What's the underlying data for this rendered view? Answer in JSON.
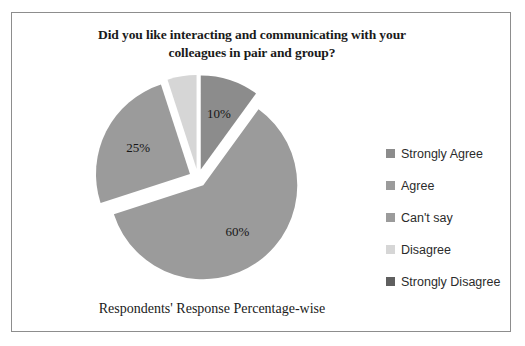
{
  "frame": {
    "border_color": "#8d8d8d",
    "background": "#ffffff"
  },
  "chart_data": {
    "type": "pie",
    "title": "Did you like interacting and communicating with your colleagues in pair and group?",
    "title_line1": "Did you like interacting and communicating with your",
    "title_line2": "colleagues in pair and group?",
    "xlabel": "Respondents' Response Percentage-wise",
    "ylabel": "",
    "legend_position": "right",
    "exploded": true,
    "start_angle_deg": 0,
    "direction": "clockwise",
    "categories": [
      "Strongly Agree",
      "Agree",
      "Can't say",
      "Disagree",
      "Strongly Disagree"
    ],
    "values": [
      10,
      60,
      25,
      5,
      0
    ],
    "data_labels": [
      "10%",
      "60%",
      "25%",
      "5%",
      "0%"
    ],
    "colors": [
      "#8c8c8c",
      "#9b9b9b",
      "#9b9b9b",
      "#d6d6d6",
      "#5f5f5f"
    ],
    "slices": [
      {
        "label": "Strongly Agree",
        "value": 10,
        "display": "10%",
        "color": "#8c8c8c",
        "label_inside": true
      },
      {
        "label": "Agree",
        "value": 60,
        "display": "60%",
        "color": "#9b9b9b",
        "label_inside": true
      },
      {
        "label": "Can't say",
        "value": 25,
        "display": "25%",
        "color": "#9b9b9b",
        "label_inside": true
      },
      {
        "label": "Disagree",
        "value": 5,
        "display": "5%",
        "color": "#d6d6d6",
        "label_inside": false
      },
      {
        "label": "Strongly Disagree",
        "value": 0,
        "display": "0%",
        "color": "#5f5f5f",
        "label_inside": false
      }
    ]
  },
  "legend": {
    "items": [
      {
        "label": "Strongly Agree",
        "color": "#8c8c8c"
      },
      {
        "label": "Agree",
        "color": "#9b9b9b"
      },
      {
        "label": "Can't say",
        "color": "#9b9b9b"
      },
      {
        "label": "Disagree",
        "color": "#d6d6d6"
      },
      {
        "label": "Strongly Disagree",
        "color": "#5f5f5f"
      }
    ]
  }
}
